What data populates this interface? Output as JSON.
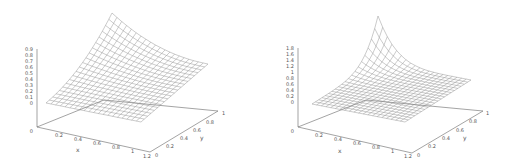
{
  "chart_data": [
    {
      "type": "surface3d",
      "title": "",
      "xlabel": "x",
      "ylabel": "y",
      "zlabel": "",
      "x_ticks": [
        "0",
        "0.2",
        "0.4",
        "0.6",
        "0.8",
        "1",
        "1.2"
      ],
      "y_ticks": [
        "0",
        "0.2",
        "0.4",
        "0.6",
        "0.8",
        "1"
      ],
      "z_ticks": [
        "0",
        "0.1",
        "0.2",
        "0.3",
        "0.4",
        "0.5",
        "0.6",
        "0.7",
        "0.8",
        "0.9"
      ],
      "xlim": [
        0,
        1.2
      ],
      "ylim": [
        0,
        1
      ],
      "zlim": [
        0,
        0.9
      ],
      "grid_resolution": 20,
      "surface_corners": {
        "x0_y0": 0.05,
        "x1_y0": 0.0,
        "x0_y1": 0.9,
        "x1_y1": 0.45
      },
      "description": "Wireframe mesh surface rising smoothly toward x=0,y=1 corner with peak ~0.9"
    },
    {
      "type": "surface3d",
      "title": "",
      "xlabel": "x",
      "ylabel": "y",
      "zlabel": "",
      "x_ticks": [
        "0",
        "0.2",
        "0.4",
        "0.6",
        "0.8",
        "1",
        "1.2"
      ],
      "y_ticks": [
        "0",
        "0.2",
        "0.4",
        "0.6",
        "0.8",
        "1"
      ],
      "z_ticks": [
        "0",
        "0.2",
        "0.4",
        "0.6",
        "0.8",
        "1",
        "1.2",
        "1.4",
        "1.6",
        "1.8"
      ],
      "xlim": [
        0,
        1.2
      ],
      "ylim": [
        0,
        1
      ],
      "zlim": [
        0,
        1.8
      ],
      "grid_resolution": 20,
      "surface_corners": {
        "x0_y0": 0.0,
        "x1_y0": 0.0,
        "x0_y1": 1.8,
        "x1_y1": 0.3
      },
      "description": "Wireframe mesh surface, mostly flat with a sharp peak ~1.8 at x=0,y=1 corner"
    }
  ],
  "panels": [
    {
      "z_ticks": [
        "0.9",
        "0.8",
        "0.7",
        "0.6",
        "0.5",
        "0.4",
        "0.3",
        "0.2",
        "0.1",
        "0"
      ],
      "x_ticks": [
        "0.2",
        "0.4",
        "0.6",
        "0.8",
        "1",
        "1.2"
      ],
      "y_ticks": [
        "0",
        "0.2",
        "0.4",
        "0.6",
        "0.8",
        "1"
      ],
      "origin_label": "0",
      "xlabel": "x",
      "ylabel": "y"
    },
    {
      "z_ticks": [
        "1.8",
        "1.6",
        "1.4",
        "1.2",
        "1",
        "0.8",
        "0.6",
        "0.4",
        "0.2",
        "0"
      ],
      "x_ticks": [
        "0.2",
        "0.4",
        "0.6",
        "0.8",
        "1",
        "1.2"
      ],
      "y_ticks": [
        "0",
        "0.2",
        "0.4",
        "0.6",
        "0.8",
        "1"
      ],
      "origin_label": "0",
      "xlabel": "x",
      "ylabel": "y"
    }
  ]
}
